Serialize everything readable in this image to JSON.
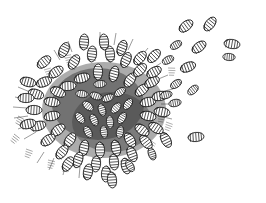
{
  "page": {
    "background_color": "#ffffff",
    "width": 266,
    "height": 203,
    "cutoff_header_text": "but of"
  },
  "figure": {
    "title": "BOTS",
    "title_color": "#262626",
    "caption": "",
    "medium": "pen-and-ink line engraving",
    "ink_color": "#1a1a1a",
    "rule_color": "#ededf0"
  },
  "illustration_data": {
    "type": "line-drawing",
    "description": "A dense radial mass of segmented grub-like botfly larvae clustered together, with individual larvae radiating outward from the central mass and scattered stragglers to the upper right and lower right on blank white ground.",
    "cluster_center": [
      104,
      110
    ],
    "cluster_radius_x": 78,
    "cluster_radius_y": 62,
    "larva_count_cluster": 150,
    "larva_count_scattered": 17,
    "scattered_larvae": [
      {
        "x": 186,
        "y": 26,
        "angle": -38,
        "len": 17,
        "w": 8
      },
      {
        "x": 210,
        "y": 24,
        "angle": -52,
        "len": 16,
        "w": 8
      },
      {
        "x": 176,
        "y": 45,
        "angle": -30,
        "len": 15,
        "w": 7
      },
      {
        "x": 199,
        "y": 47,
        "angle": -36,
        "len": 16,
        "w": 8
      },
      {
        "x": 232,
        "y": 44,
        "angle": 8,
        "len": 17,
        "w": 8
      },
      {
        "x": 229,
        "y": 57,
        "angle": 4,
        "len": 13,
        "w": 6
      },
      {
        "x": 168,
        "y": 60,
        "angle": -28,
        "len": 15,
        "w": 7
      },
      {
        "x": 188,
        "y": 67,
        "angle": -22,
        "len": 15,
        "w": 7
      },
      {
        "x": 176,
        "y": 84,
        "angle": -34,
        "len": 15,
        "w": 7
      },
      {
        "x": 193,
        "y": 90,
        "angle": -40,
        "len": 14,
        "w": 7
      },
      {
        "x": 166,
        "y": 95,
        "angle": -16,
        "len": 14,
        "w": 7
      },
      {
        "x": 175,
        "y": 103,
        "angle": -12,
        "len": 13,
        "w": 6
      },
      {
        "x": 196,
        "y": 137,
        "angle": -6,
        "len": 17,
        "w": 8
      },
      {
        "x": 166,
        "y": 140,
        "angle": 62,
        "len": 16,
        "w": 8
      },
      {
        "x": 152,
        "y": 154,
        "angle": 70,
        "len": 15,
        "w": 7
      },
      {
        "x": 112,
        "y": 176,
        "angle": 84,
        "len": 16,
        "w": 8
      },
      {
        "x": 130,
        "y": 166,
        "angle": 60,
        "len": 14,
        "w": 7
      }
    ],
    "hatch_accents": [
      {
        "x": 22,
        "y": 118,
        "angle": 20
      },
      {
        "x": 18,
        "y": 136,
        "angle": 30
      },
      {
        "x": 30,
        "y": 150,
        "angle": 12
      },
      {
        "x": 52,
        "y": 160,
        "angle": 5
      },
      {
        "x": 160,
        "y": 116,
        "angle": 0
      },
      {
        "x": 172,
        "y": 70,
        "angle": 0
      },
      {
        "x": 68,
        "y": 58,
        "angle": 0
      }
    ]
  }
}
